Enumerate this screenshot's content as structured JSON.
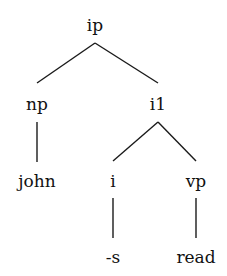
{
  "diagram": {
    "type": "syntax-tree",
    "nodes": [
      {
        "id": "ip",
        "label": "ip",
        "x": 95,
        "y": 26
      },
      {
        "id": "np",
        "label": "np",
        "x": 37,
        "y": 105
      },
      {
        "id": "i1",
        "label": "i1",
        "x": 158,
        "y": 105
      },
      {
        "id": "john",
        "label": "john",
        "x": 37,
        "y": 182
      },
      {
        "id": "i",
        "label": "i",
        "x": 113,
        "y": 182
      },
      {
        "id": "vp",
        "label": "vp",
        "x": 196,
        "y": 182
      },
      {
        "id": "s",
        "label": "-s",
        "x": 113,
        "y": 258
      },
      {
        "id": "read",
        "label": "read",
        "x": 196,
        "y": 258
      }
    ],
    "edges": [
      {
        "from": "ip",
        "to": "np"
      },
      {
        "from": "ip",
        "to": "i1"
      },
      {
        "from": "np",
        "to": "john"
      },
      {
        "from": "i1",
        "to": "i"
      },
      {
        "from": "i1",
        "to": "vp"
      },
      {
        "from": "i",
        "to": "s"
      },
      {
        "from": "vp",
        "to": "read"
      }
    ]
  }
}
